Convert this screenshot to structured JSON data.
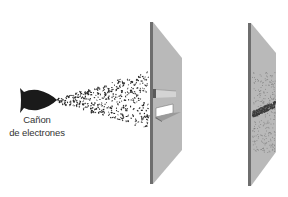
{
  "diagram": {
    "type": "double-slit-electron-experiment",
    "labels": {
      "gun_line1": "Cañon",
      "gun_line2": "de electrones"
    },
    "elements": {
      "electron_gun": {
        "name": "electron-gun",
        "color": "#1a1a1a"
      },
      "electron_spray": {
        "name": "electron-beam",
        "dot_color": "#222222"
      },
      "slit_plate": {
        "name": "double-slit-plate",
        "face_color": "#b8b8b8",
        "edge_color": "#6e6e6e",
        "slits": 2
      },
      "screen_plate": {
        "name": "detection-screen",
        "face_color": "#b8b8b8",
        "edge_color": "#6e6e6e",
        "pattern": "diagonal-band-of-impacts"
      }
    },
    "colors": {
      "background": "#ffffff",
      "text": "#333333",
      "plate_face": "#b8b8b8",
      "plate_edge": "#6e6e6e",
      "slit_opening": "#ffffff",
      "ink": "#1a1a1a"
    }
  }
}
